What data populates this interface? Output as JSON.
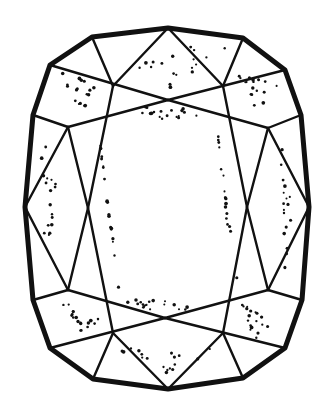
{
  "figure": {
    "background": "#ffffff",
    "line_color": "#111111",
    "outline_points": [
      [
        50,
        65
      ],
      [
        92,
        37
      ],
      [
        168,
        28
      ],
      [
        243,
        38
      ],
      [
        285,
        70
      ],
      [
        301,
        115
      ],
      [
        309,
        207
      ],
      [
        302,
        300
      ],
      [
        285,
        348
      ],
      [
        243,
        378
      ],
      [
        168,
        389
      ],
      [
        93,
        379
      ],
      [
        50,
        348
      ],
      [
        33,
        300
      ],
      [
        25,
        207
      ],
      [
        33,
        115
      ]
    ],
    "facet_lines": [
      [
        [
          92,
          37
        ],
        [
          113,
          86
        ]
      ],
      [
        [
          168,
          28
        ],
        [
          113,
          86
        ]
      ],
      [
        [
          168,
          28
        ],
        [
          223,
          86
        ]
      ],
      [
        [
          243,
          38
        ],
        [
          223,
          86
        ]
      ],
      [
        [
          50,
          65
        ],
        [
          168,
          100
        ]
      ],
      [
        [
          168,
          100
        ],
        [
          285,
          70
        ]
      ],
      [
        [
          68,
          127
        ],
        [
          168,
          100
        ]
      ],
      [
        [
          168,
          100
        ],
        [
          268,
          128
        ]
      ],
      [
        [
          33,
          115
        ],
        [
          68,
          127
        ]
      ],
      [
        [
          268,
          128
        ],
        [
          301,
          115
        ]
      ],
      [
        [
          113,
          86
        ],
        [
          88,
          208
        ]
      ],
      [
        [
          68,
          127
        ],
        [
          88,
          208
        ]
      ],
      [
        [
          68,
          127
        ],
        [
          25,
          207
        ]
      ],
      [
        [
          223,
          86
        ],
        [
          247,
          207
        ]
      ],
      [
        [
          268,
          128
        ],
        [
          247,
          207
        ]
      ],
      [
        [
          268,
          128
        ],
        [
          309,
          207
        ]
      ],
      [
        [
          88,
          208
        ],
        [
          113,
          333
        ]
      ],
      [
        [
          88,
          208
        ],
        [
          68,
          290
        ]
      ],
      [
        [
          25,
          207
        ],
        [
          68,
          290
        ]
      ],
      [
        [
          247,
          207
        ],
        [
          223,
          333
        ]
      ],
      [
        [
          247,
          207
        ],
        [
          268,
          290
        ]
      ],
      [
        [
          309,
          207
        ],
        [
          268,
          290
        ]
      ],
      [
        [
          33,
          300
        ],
        [
          68,
          290
        ]
      ],
      [
        [
          268,
          290
        ],
        [
          302,
          300
        ]
      ],
      [
        [
          68,
          290
        ],
        [
          165,
          318
        ]
      ],
      [
        [
          165,
          318
        ],
        [
          268,
          290
        ]
      ],
      [
        [
          50,
          348
        ],
        [
          165,
          318
        ]
      ],
      [
        [
          165,
          318
        ],
        [
          285,
          348
        ]
      ],
      [
        [
          93,
          379
        ],
        [
          113,
          333
        ]
      ],
      [
        [
          168,
          389
        ],
        [
          113,
          333
        ]
      ],
      [
        [
          168,
          389
        ],
        [
          223,
          333
        ]
      ],
      [
        [
          243,
          378
        ],
        [
          223,
          333
        ]
      ]
    ]
  }
}
